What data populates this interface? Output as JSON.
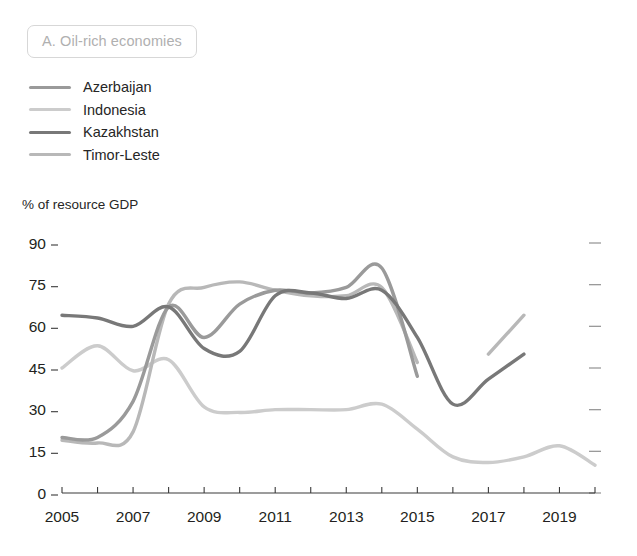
{
  "panel": {
    "title": "A. Oil-rich economies"
  },
  "axis": {
    "y_axis_title": "% of resource GDP"
  },
  "chart_data": {
    "type": "line",
    "title": "A. Oil-rich economies",
    "xlabel": "",
    "ylabel": "% of resource GDP",
    "xlim": [
      2005,
      2020
    ],
    "ylim": [
      0,
      90
    ],
    "ytick_labels": [
      "0",
      "15",
      "30",
      "45",
      "60",
      "75",
      "90"
    ],
    "ytick_values": [
      0,
      15,
      30,
      45,
      60,
      75,
      90
    ],
    "xtick_labels": [
      "2005",
      "2007",
      "2009",
      "2011",
      "2013",
      "2015",
      "2017",
      "2019"
    ],
    "xtick_values": [
      2005,
      2007,
      2009,
      2011,
      2013,
      2015,
      2017,
      2019
    ],
    "grid": false,
    "legend_position": "top-left",
    "x": [
      2005,
      2006,
      2007,
      2008,
      2009,
      2010,
      2011,
      2012,
      2013,
      2014,
      2015,
      2016,
      2017,
      2018,
      2019,
      2020
    ],
    "series": [
      {
        "name": "Azerbaijan",
        "color": "#9a9a9a",
        "values": [
          20,
          20,
          33,
          67,
          56,
          68,
          73,
          72,
          74,
          81,
          42,
          null,
          null,
          null,
          null,
          null
        ]
      },
      {
        "name": "Indonesia",
        "color": "#cccccc",
        "values": [
          45,
          53,
          44,
          48,
          31,
          29,
          30,
          30,
          30,
          32,
          23,
          13,
          11,
          13,
          17,
          10
        ]
      },
      {
        "name": "Kazakhstan",
        "color": "#787878",
        "values": [
          64,
          63,
          60,
          67,
          52,
          51,
          71,
          72,
          70,
          73,
          56,
          32,
          41,
          50,
          null,
          null
        ]
      },
      {
        "name": "Timor-Leste",
        "color": "#b8b8b8",
        "values": [
          19,
          18,
          22,
          68,
          74,
          76,
          73,
          71,
          71,
          74,
          47,
          null,
          50,
          64,
          null,
          null
        ]
      }
    ]
  },
  "legend": {
    "items": [
      {
        "label": "Azerbaijan",
        "color": "#9a9a9a"
      },
      {
        "label": "Indonesia",
        "color": "#cccccc"
      },
      {
        "label": "Kazakhstan",
        "color": "#787878"
      },
      {
        "label": "Timor-Leste",
        "color": "#b8b8b8"
      }
    ]
  }
}
